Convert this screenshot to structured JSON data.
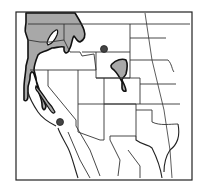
{
  "map": {
    "type": "species range map",
    "region": "Western United States",
    "width": 199,
    "height": 190,
    "colors": {
      "background": "#ffffff",
      "range_fill": "#a8a8a8",
      "outline": "#111111",
      "point_marker": "#444444"
    },
    "legend": null,
    "features": {
      "range_areas": [
        {
          "name": "pacific-northwest-range",
          "description": "Washington, northern Idaho, western Montana, western Oregon"
        },
        {
          "name": "northern-california-range",
          "description": "Coast ranges and Sierra Nevada strip"
        },
        {
          "name": "colorado-front-range",
          "description": "Northeastern Colorado / southeastern Wyoming patch with southern tail"
        }
      ],
      "isolated_points": [
        {
          "name": "wyoming-point",
          "x": 104,
          "y": 49
        },
        {
          "name": "southern-california-point",
          "x": 60,
          "y": 122
        }
      ],
      "excluded_areas": [
        {
          "name": "central-washington-gap",
          "description": "White unshaded area within the northwest range"
        }
      ]
    }
  }
}
